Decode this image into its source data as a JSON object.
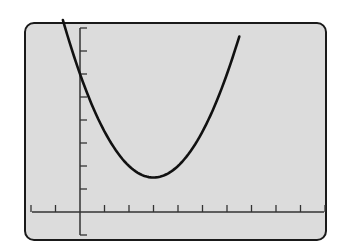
{
  "chart_data": {
    "type": "line",
    "title": "",
    "xlabel": "",
    "ylabel": "",
    "function": "y = 0.5(x - 3)^2 + 1.5",
    "xlim": [
      -2,
      10
    ],
    "ylim": [
      -1,
      8
    ],
    "x_tick_step": 1,
    "y_tick_step": 1,
    "grid": false,
    "legend": null,
    "series": [
      {
        "name": "parabola",
        "x": [
          -0.7,
          0,
          0.5,
          1,
          1.5,
          2,
          2.5,
          3,
          3.5,
          4,
          4.5,
          5,
          5.5,
          6,
          6.5
        ],
        "values": [
          8.35,
          6.0,
          4.63,
          3.5,
          2.63,
          2.0,
          1.63,
          1.5,
          1.63,
          2.0,
          2.63,
          3.5,
          4.63,
          6.0,
          7.63
        ]
      }
    ],
    "vertex": [
      3,
      1.5
    ],
    "y_intercept": 6
  },
  "colors": {
    "screen_bg": "#dcdcdc",
    "frame": "#1a1a1a",
    "curve": "#111111",
    "axes": "#333333"
  }
}
